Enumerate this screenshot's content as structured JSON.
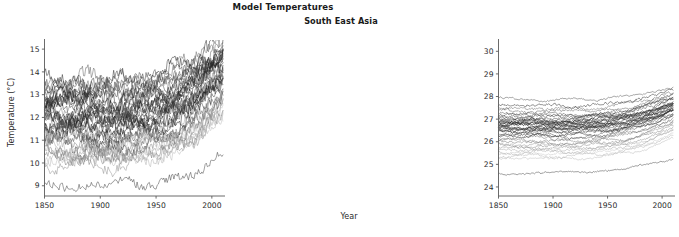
{
  "figure": {
    "title": "Time Series of Regional Model Temperatures",
    "background_color": "#ffffff",
    "width": 446,
    "height": 237
  },
  "chart_data": [
    {
      "type": "line",
      "panel_index": 0,
      "title": "Central North America",
      "xlabel": "Year",
      "ylabel": "Temperature (°C)",
      "xlim": [
        1850,
        2010
      ],
      "ylim": [
        8.55,
        15.4
      ],
      "xticks": [
        1850,
        1900,
        1950,
        2000
      ],
      "xticklabels": [
        "1850",
        "1900",
        "1950",
        "2000"
      ],
      "yticks": [
        9,
        10,
        11,
        12,
        13,
        14,
        15
      ],
      "yticklabels": [
        "9",
        "10",
        "11",
        "12",
        "13",
        "14",
        "15"
      ],
      "grid": false,
      "legend": "none",
      "n_series": 42,
      "series_description": "Spaghetti ensemble of CMIP model runs, grayscale lines, high interannual variability",
      "series": [
        {
          "name": "run-01",
          "gray": "#111111",
          "start": 11.55,
          "end": 13.95,
          "dip_1910": 11.15,
          "noise": 0.42
        },
        {
          "name": "run-02",
          "gray": "#262626",
          "start": 12.35,
          "end": 14.65,
          "dip_1910": 11.95,
          "noise": 0.4
        },
        {
          "name": "run-03",
          "gray": "#3d3d3d",
          "start": 13.05,
          "end": 15.05,
          "dip_1910": 12.7,
          "noise": 0.44
        },
        {
          "name": "run-04",
          "gray": "#1b1b1b",
          "start": 10.85,
          "end": 13.25,
          "dip_1910": 10.45,
          "noise": 0.38
        },
        {
          "name": "run-05",
          "gray": "#555555",
          "start": 13.55,
          "end": 15.25,
          "dip_1910": 13.25,
          "noise": 0.43
        },
        {
          "name": "run-06",
          "gray": "#2f2f2f",
          "start": 11.95,
          "end": 14.2,
          "dip_1910": 11.55,
          "noise": 0.41
        },
        {
          "name": "run-07",
          "gray": "#6a6a6a",
          "start": 10.35,
          "end": 12.55,
          "dip_1910": 10.05,
          "noise": 0.39
        },
        {
          "name": "run-08",
          "gray": "#1f1f1f",
          "start": 12.75,
          "end": 14.85,
          "dip_1910": 12.4,
          "noise": 0.45
        },
        {
          "name": "run-09",
          "gray": "#474747",
          "start": 11.35,
          "end": 13.6,
          "dip_1910": 10.95,
          "noise": 0.37
        },
        {
          "name": "run-10",
          "gray": "#8a8a8a",
          "start": 10.05,
          "end": 12.1,
          "dip_1910": 9.75,
          "noise": 0.36
        },
        {
          "name": "run-11",
          "gray": "#141414",
          "start": 12.15,
          "end": 14.45,
          "dip_1910": 11.75,
          "noise": 0.43
        },
        {
          "name": "run-12",
          "gray": "#3a3a3a",
          "start": 13.3,
          "end": 15.15,
          "dip_1910": 12.95,
          "noise": 0.42
        },
        {
          "name": "run-13",
          "gray": "#5e5e5e",
          "start": 11.05,
          "end": 13.1,
          "dip_1910": 10.7,
          "noise": 0.4
        },
        {
          "name": "run-14",
          "gray": "#272727",
          "start": 12.55,
          "end": 14.7,
          "dip_1910": 12.15,
          "noise": 0.44
        },
        {
          "name": "run-15",
          "gray": "#9b9b9b",
          "start": 10.55,
          "end": 12.35,
          "dip_1910": 10.25,
          "noise": 0.35
        },
        {
          "name": "run-16",
          "gray": "#191919",
          "start": 11.75,
          "end": 14.05,
          "dip_1910": 11.35,
          "noise": 0.41
        },
        {
          "name": "run-17",
          "gray": "#424242",
          "start": 12.95,
          "end": 14.95,
          "dip_1910": 12.6,
          "noise": 0.43
        },
        {
          "name": "run-18",
          "gray": "#707070",
          "start": 10.75,
          "end": 12.8,
          "dip_1910": 10.4,
          "noise": 0.38
        },
        {
          "name": "run-19",
          "gray": "#2b2b2b",
          "start": 12.25,
          "end": 14.5,
          "dip_1910": 11.85,
          "noise": 0.42
        },
        {
          "name": "run-20",
          "gray": "#aeaeae",
          "start": 10.2,
          "end": 11.95,
          "dip_1910": 9.95,
          "noise": 0.34
        },
        {
          "name": "run-21",
          "gray": "#121212",
          "start": 11.45,
          "end": 13.85,
          "dip_1910": 11.05,
          "noise": 0.44
        },
        {
          "name": "run-22",
          "gray": "#505050",
          "start": 13.15,
          "end": 15.1,
          "dip_1910": 12.8,
          "noise": 0.41
        },
        {
          "name": "run-23",
          "gray": "#343434",
          "start": 11.85,
          "end": 14.15,
          "dip_1910": 11.45,
          "noise": 0.4
        },
        {
          "name": "run-24",
          "gray": "#7d7d7d",
          "start": 10.45,
          "end": 12.45,
          "dip_1910": 10.15,
          "noise": 0.37
        },
        {
          "name": "run-25",
          "gray": "#1d1d1d",
          "start": 12.65,
          "end": 14.75,
          "dip_1910": 12.25,
          "noise": 0.45
        },
        {
          "name": "run-26",
          "gray": "#4c4c4c",
          "start": 11.25,
          "end": 13.45,
          "dip_1910": 10.85,
          "noise": 0.39
        },
        {
          "name": "run-27",
          "gray": "#c2c2c2",
          "start": 10.9,
          "end": 12.25,
          "dip_1910": 10.6,
          "noise": 0.33
        },
        {
          "name": "run-28",
          "gray": "#232323",
          "start": 12.05,
          "end": 14.35,
          "dip_1910": 11.65,
          "noise": 0.43
        },
        {
          "name": "run-29",
          "gray": "#646464",
          "start": 13.45,
          "end": 15.2,
          "dip_1910": 13.1,
          "noise": 0.4
        },
        {
          "name": "run-30",
          "gray": "#2e2e2e",
          "start": 11.65,
          "end": 13.95,
          "dip_1910": 11.25,
          "noise": 0.42
        },
        {
          "name": "run-31",
          "gray": "#8f8f8f",
          "start": 10.65,
          "end": 12.6,
          "dip_1910": 10.3,
          "noise": 0.36
        },
        {
          "name": "run-32",
          "gray": "#161616",
          "start": 12.85,
          "end": 14.9,
          "dip_1910": 12.5,
          "noise": 0.44
        },
        {
          "name": "run-33",
          "gray": "#3f3f3f",
          "start": 11.15,
          "end": 13.35,
          "dip_1910": 10.75,
          "noise": 0.38
        },
        {
          "name": "run-34",
          "gray": "#777777",
          "start": 12.45,
          "end": 14.25,
          "dip_1910": 12.05,
          "noise": 0.41
        },
        {
          "name": "run-35",
          "gray": "#202020",
          "start": 13.75,
          "end": 15.3,
          "dip_1910": 13.4,
          "noise": 0.43
        },
        {
          "name": "run-36",
          "gray": "#b5b5b5",
          "start": 10.3,
          "end": 11.85,
          "dip_1910": 10.0,
          "noise": 0.34
        },
        {
          "name": "run-37",
          "gray": "#585858",
          "start": 11.95,
          "end": 14.0,
          "dip_1910": 11.55,
          "noise": 0.4
        },
        {
          "name": "run-38",
          "gray": "#2a2a2a",
          "start": 12.6,
          "end": 14.6,
          "dip_1910": 12.2,
          "noise": 0.42
        },
        {
          "name": "run-39",
          "gray": "#a3a3a3",
          "start": 10.85,
          "end": 12.7,
          "dip_1910": 10.5,
          "noise": 0.35
        },
        {
          "name": "run-40",
          "gray": "#373737",
          "start": 13.25,
          "end": 15.0,
          "dip_1910": 12.9,
          "noise": 0.41
        },
        {
          "name": "run-41",
          "gray": "#cfcfcf",
          "start": 11.05,
          "end": 12.15,
          "dip_1910": 10.8,
          "noise": 0.32
        },
        {
          "name": "run-42-outlier-low",
          "gray": "#3a3a3a",
          "start": 9.05,
          "end": 10.3,
          "dip_1910": 8.8,
          "noise": 0.26
        }
      ]
    },
    {
      "type": "line",
      "panel_index": 1,
      "title": "South East Asia",
      "xlabel": "Year",
      "ylabel": "",
      "xlim": [
        1850,
        2010
      ],
      "ylim": [
        23.6,
        30.5
      ],
      "xticks": [
        1850,
        1900,
        1950,
        2000
      ],
      "xticklabels": [
        "1850",
        "1900",
        "1950",
        "2000"
      ],
      "yticks": [
        24,
        25,
        26,
        27,
        28,
        29,
        30
      ],
      "yticklabels": [
        "24",
        "25",
        "26",
        "27",
        "28",
        "29",
        "30"
      ],
      "grid": false,
      "legend": "none",
      "n_series": 42,
      "series_description": "Spaghetti ensemble of CMIP model runs, grayscale lines, low interannual variability, tight tropical band",
      "series": [
        {
          "name": "run-01",
          "gray": "#111111",
          "start": 26.55,
          "end": 27.4,
          "dip_1910": 26.48,
          "noise": 0.085
        },
        {
          "name": "run-02",
          "gray": "#262626",
          "start": 26.75,
          "end": 27.62,
          "dip_1910": 26.68,
          "noise": 0.08
        },
        {
          "name": "run-03",
          "gray": "#3d3d3d",
          "start": 27.05,
          "end": 27.92,
          "dip_1910": 26.98,
          "noise": 0.09
        },
        {
          "name": "run-04",
          "gray": "#1b1b1b",
          "start": 26.3,
          "end": 27.18,
          "dip_1910": 26.22,
          "noise": 0.078
        },
        {
          "name": "run-05",
          "gray": "#555555",
          "start": 27.35,
          "end": 28.12,
          "dip_1910": 27.28,
          "noise": 0.086
        },
        {
          "name": "run-06",
          "gray": "#2f2f2f",
          "start": 26.62,
          "end": 27.5,
          "dip_1910": 26.55,
          "noise": 0.082
        },
        {
          "name": "run-07",
          "gray": "#6a6a6a",
          "start": 25.95,
          "end": 26.85,
          "dip_1910": 25.88,
          "noise": 0.076
        },
        {
          "name": "run-08",
          "gray": "#1f1f1f",
          "start": 26.88,
          "end": 27.75,
          "dip_1910": 26.8,
          "noise": 0.09
        },
        {
          "name": "run-09",
          "gray": "#474747",
          "start": 26.42,
          "end": 27.3,
          "dip_1910": 26.35,
          "noise": 0.074
        },
        {
          "name": "run-10",
          "gray": "#8a8a8a",
          "start": 25.7,
          "end": 26.62,
          "dip_1910": 25.62,
          "noise": 0.072
        },
        {
          "name": "run-11",
          "gray": "#141414",
          "start": 26.68,
          "end": 27.56,
          "dip_1910": 26.6,
          "noise": 0.086
        },
        {
          "name": "run-12",
          "gray": "#3a3a3a",
          "start": 27.12,
          "end": 27.98,
          "dip_1910": 27.05,
          "noise": 0.084
        },
        {
          "name": "run-13",
          "gray": "#5e5e5e",
          "start": 26.15,
          "end": 27.05,
          "dip_1910": 26.08,
          "noise": 0.08
        },
        {
          "name": "run-14",
          "gray": "#272727",
          "start": 26.82,
          "end": 27.68,
          "dip_1910": 26.75,
          "noise": 0.088
        },
        {
          "name": "run-15",
          "gray": "#9b9b9b",
          "start": 25.55,
          "end": 26.48,
          "dip_1910": 25.48,
          "noise": 0.07
        },
        {
          "name": "run-16",
          "gray": "#191919",
          "start": 26.58,
          "end": 27.46,
          "dip_1910": 26.5,
          "noise": 0.082
        },
        {
          "name": "run-17",
          "gray": "#424242",
          "start": 26.98,
          "end": 27.85,
          "dip_1910": 26.9,
          "noise": 0.086
        },
        {
          "name": "run-18",
          "gray": "#707070",
          "start": 26.05,
          "end": 26.95,
          "dip_1910": 25.98,
          "noise": 0.076
        },
        {
          "name": "run-19",
          "gray": "#2b2b2b",
          "start": 26.72,
          "end": 27.6,
          "dip_1910": 26.65,
          "noise": 0.084
        },
        {
          "name": "run-20",
          "gray": "#aeaeae",
          "start": 25.35,
          "end": 26.3,
          "dip_1910": 25.28,
          "noise": 0.068
        },
        {
          "name": "run-21",
          "gray": "#121212",
          "start": 26.48,
          "end": 27.36,
          "dip_1910": 26.4,
          "noise": 0.088
        },
        {
          "name": "run-22",
          "gray": "#505050",
          "start": 27.22,
          "end": 28.05,
          "dip_1910": 27.15,
          "noise": 0.082
        },
        {
          "name": "run-23",
          "gray": "#343434",
          "start": 26.65,
          "end": 27.52,
          "dip_1910": 26.58,
          "noise": 0.08
        },
        {
          "name": "run-24",
          "gray": "#7d7d7d",
          "start": 25.82,
          "end": 26.75,
          "dip_1910": 25.75,
          "noise": 0.074
        },
        {
          "name": "run-25",
          "gray": "#1d1d1d",
          "start": 26.92,
          "end": 27.78,
          "dip_1910": 26.85,
          "noise": 0.09
        },
        {
          "name": "run-26",
          "gray": "#4c4c4c",
          "start": 26.35,
          "end": 27.24,
          "dip_1910": 26.28,
          "noise": 0.078
        },
        {
          "name": "run-27",
          "gray": "#c2c2c2",
          "start": 25.48,
          "end": 26.4,
          "dip_1910": 25.4,
          "noise": 0.066
        },
        {
          "name": "run-28",
          "gray": "#232323",
          "start": 26.78,
          "end": 27.64,
          "dip_1910": 26.7,
          "noise": 0.086
        },
        {
          "name": "run-29",
          "gray": "#646464",
          "start": 27.45,
          "end": 28.2,
          "dip_1910": 27.38,
          "noise": 0.08
        },
        {
          "name": "run-30",
          "gray": "#2e2e2e",
          "start": 26.52,
          "end": 27.42,
          "dip_1910": 26.45,
          "noise": 0.084
        },
        {
          "name": "run-31",
          "gray": "#8f8f8f",
          "start": 25.9,
          "end": 26.8,
          "dip_1910": 25.82,
          "noise": 0.072
        },
        {
          "name": "run-32",
          "gray": "#161616",
          "start": 26.95,
          "end": 27.82,
          "dip_1910": 26.88,
          "noise": 0.088
        },
        {
          "name": "run-33",
          "gray": "#3f3f3f",
          "start": 26.25,
          "end": 27.14,
          "dip_1910": 26.18,
          "noise": 0.076
        },
        {
          "name": "run-34",
          "gray": "#777777",
          "start": 26.85,
          "end": 27.7,
          "dip_1910": 26.78,
          "noise": 0.082
        },
        {
          "name": "run-35",
          "gray": "#202020",
          "start": 27.58,
          "end": 28.28,
          "dip_1910": 27.5,
          "noise": 0.086
        },
        {
          "name": "run-36",
          "gray": "#b5b5b5",
          "start": 25.25,
          "end": 26.2,
          "dip_1910": 25.18,
          "noise": 0.064
        },
        {
          "name": "run-37",
          "gray": "#585858",
          "start": 26.6,
          "end": 27.48,
          "dip_1910": 26.52,
          "noise": 0.08
        },
        {
          "name": "run-38",
          "gray": "#2a2a2a",
          "start": 26.8,
          "end": 27.66,
          "dip_1910": 26.72,
          "noise": 0.084
        },
        {
          "name": "run-39",
          "gray": "#a3a3a3",
          "start": 25.62,
          "end": 26.55,
          "dip_1910": 25.55,
          "noise": 0.07
        },
        {
          "name": "run-40",
          "gray": "#373737",
          "start": 27.18,
          "end": 28.02,
          "dip_1910": 27.1,
          "noise": 0.082
        },
        {
          "name": "run-41-top-outlier",
          "gray": "#4a4a4a",
          "start": 27.88,
          "end": 28.38,
          "dip_1910": 27.82,
          "noise": 0.06
        },
        {
          "name": "run-42-outlier-low",
          "gray": "#3a3a3a",
          "start": 24.62,
          "end": 25.32,
          "dip_1910": 24.58,
          "noise": 0.055
        }
      ]
    }
  ],
  "axes": {
    "tick_color": "#5a5a5a",
    "text_color": "#2b2b2b",
    "title_color": "#1a1a1a"
  }
}
